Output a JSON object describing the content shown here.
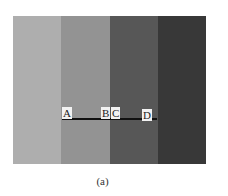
{
  "figure": {
    "bars": [
      {
        "name": "bar-1",
        "color": "#b4b4b4",
        "width": 48
      },
      {
        "name": "bar-2",
        "color": "#989898",
        "width": 49
      },
      {
        "name": "bar-3",
        "color": "#5a5a5a",
        "width": 48
      },
      {
        "name": "bar-4",
        "color": "#3a3a3a",
        "width": 48
      }
    ],
    "points": [
      {
        "label": "A",
        "x": 62,
        "y": 107
      },
      {
        "label": "B",
        "x": 101,
        "y": 107
      },
      {
        "label": "C",
        "x": 111,
        "y": 107
      },
      {
        "label": "D",
        "x": 142,
        "y": 109
      }
    ],
    "caption": "(a)"
  }
}
